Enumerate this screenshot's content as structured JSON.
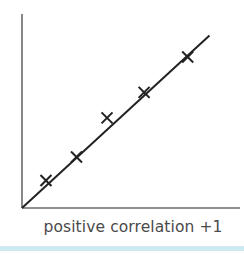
{
  "chart_data": {
    "type": "scatter",
    "title": "",
    "caption": "positive correlation +1",
    "xlabel": "",
    "ylabel": "",
    "grid": false,
    "legend": null,
    "axis_ticks": false,
    "xlim": [
      0,
      10
    ],
    "ylim": [
      0,
      10
    ],
    "points": [
      {
        "x": 1.1,
        "y": 1.4
      },
      {
        "x": 2.5,
        "y": 2.6
      },
      {
        "x": 3.9,
        "y": 4.6
      },
      {
        "x": 5.6,
        "y": 5.9
      },
      {
        "x": 7.6,
        "y": 7.7
      }
    ],
    "trend_line": {
      "x": [
        0,
        8.6
      ],
      "y": [
        0,
        8.8
      ]
    },
    "marker": "x",
    "colors": {
      "axes": "#555555",
      "line": "#222222",
      "markers": "#222222",
      "caption": "#4a4a4a",
      "bottom_bar": "#cde9f1"
    }
  },
  "caption": "positive correlation +1"
}
